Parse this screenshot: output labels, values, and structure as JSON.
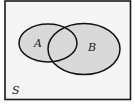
{
  "diagram": {
    "type": "venn",
    "universe": {
      "label": "S",
      "background": "#f5f5f5",
      "border_color": "#1a1a1a"
    },
    "sets": [
      {
        "id": "A",
        "label": "A",
        "fill": "#d9d9d9",
        "stroke": "#111111"
      },
      {
        "id": "B",
        "label": "B",
        "fill": "#d9d9d9",
        "stroke": "#111111"
      }
    ],
    "overlap": [
      "A",
      "B"
    ]
  }
}
